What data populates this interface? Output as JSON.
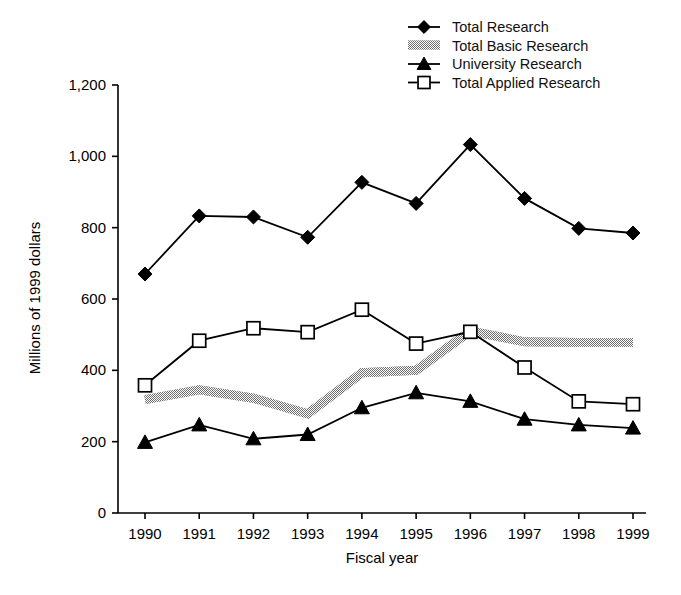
{
  "chart_data": {
    "type": "line",
    "title": "",
    "xlabel": "Fiscal year",
    "ylabel": "Millions of 1999 dollars",
    "categories": [
      "1990",
      "1991",
      "1992",
      "1993",
      "1994",
      "1995",
      "1996",
      "1997",
      "1998",
      "1999"
    ],
    "x": [
      1990,
      1991,
      1992,
      1993,
      1994,
      1995,
      1996,
      1997,
      1998,
      1999
    ],
    "ylim": [
      0,
      1200
    ],
    "yticks": [
      0,
      200,
      400,
      600,
      800,
      1000,
      1200
    ],
    "ytick_labels": [
      "0",
      "200",
      "400",
      "600",
      "800",
      "1,000",
      "1,200"
    ],
    "grid": false,
    "legend_position": "top-right",
    "series": [
      {
        "name": "Total Research",
        "marker": "filled-diamond",
        "color": "#000000",
        "values": [
          670,
          833,
          830,
          773,
          927,
          868,
          1033,
          882,
          798,
          785
        ]
      },
      {
        "name": "Total Basic Research",
        "marker": "thick-gray-band",
        "color": "#8c8c8c",
        "values": [
          318,
          345,
          322,
          278,
          393,
          400,
          510,
          480,
          478,
          478
        ]
      },
      {
        "name": "University Research",
        "marker": "filled-triangle",
        "color": "#000000",
        "values": [
          198,
          247,
          208,
          220,
          295,
          337,
          313,
          263,
          247,
          238
        ]
      },
      {
        "name": "Total Applied Research",
        "marker": "open-square",
        "color": "#000000",
        "values": [
          358,
          483,
          518,
          507,
          570,
          475,
          508,
          408,
          313,
          305
        ]
      }
    ]
  },
  "legend": {
    "items": [
      {
        "label": "Total Research",
        "marker": "filled-diamond"
      },
      {
        "label": "Total Basic Research",
        "marker": "thick-gray-band"
      },
      {
        "label": "University Research",
        "marker": "filled-triangle"
      },
      {
        "label": "Total Applied Research",
        "marker": "open-square"
      }
    ]
  },
  "axes": {
    "y_title": "Millions of 1999 dollars",
    "x_title": "Fiscal year"
  }
}
